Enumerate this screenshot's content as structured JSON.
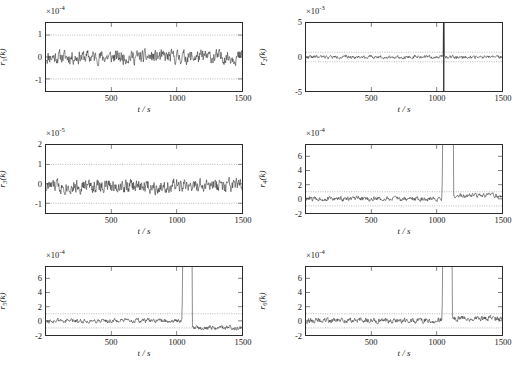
{
  "figure": {
    "caption": "",
    "panel_count": 6
  },
  "chart_data": [
    {
      "type": "line",
      "title": "",
      "panel_index": 1,
      "ylabel": "r",
      "ylabel_sub": "1",
      "ylabel_full": "r_1(k)",
      "xlabel": "t / s",
      "y_exponent_label": "×10",
      "y_exponent": "-4",
      "y_scale": 0.0001,
      "xlim": [
        0,
        1500
      ],
      "ylim": [
        -1.55,
        1.55
      ],
      "xticks": [
        500,
        1000,
        1500
      ],
      "xticklabels": [
        "500",
        "1000",
        "1500"
      ],
      "yticks": [
        -1,
        0,
        1
      ],
      "yticklabels": [
        "-1",
        "0",
        "1"
      ],
      "threshold_lines": [
        1,
        -1
      ],
      "grid": false,
      "noise_amplitude": 0.28,
      "noise_mean": 0.0,
      "fault_time": null,
      "fault_peak": null,
      "post_fault_mean": 0.0,
      "seed": 11
    },
    {
      "type": "line",
      "title": "",
      "panel_index": 2,
      "ylabel": "r",
      "ylabel_sub": "2",
      "ylabel_full": "r_2(k)",
      "xlabel": "t / s",
      "y_exponent_label": "×10",
      "y_exponent": "-3",
      "y_scale": 0.001,
      "xlim": [
        0,
        1500
      ],
      "ylim": [
        -5,
        5
      ],
      "xticks": [
        500,
        1000,
        1500
      ],
      "xticklabels": [
        "500",
        "1000",
        "1500"
      ],
      "yticks": [
        -5,
        0,
        5
      ],
      "yticklabels": [
        "-5",
        "0",
        "5"
      ],
      "threshold_lines": [
        0.7,
        -0.7
      ],
      "grid": false,
      "noise_amplitude": 0.22,
      "noise_mean": 0.0,
      "fault_time": 1050,
      "fault_peak": 5,
      "fault_type": "bipolar-impulse",
      "post_fault_mean": 0.0,
      "seed": 22
    },
    {
      "type": "line",
      "title": "",
      "panel_index": 3,
      "ylabel": "r",
      "ylabel_sub": "3",
      "ylabel_full": "r_3(k)",
      "xlabel": "t / s",
      "y_exponent_label": "×10",
      "y_exponent": "-5",
      "y_scale": 1e-05,
      "xlim": [
        0,
        1500
      ],
      "ylim": [
        -1.5,
        2
      ],
      "xticks": [
        500,
        1000,
        1500
      ],
      "xticklabels": [
        "500",
        "1000",
        "1500"
      ],
      "yticks": [
        -1,
        0,
        1,
        2
      ],
      "yticklabels": [
        "-1",
        "0",
        "1",
        "2"
      ],
      "threshold_lines": [
        1,
        -1
      ],
      "grid": false,
      "noise_amplitude": 0.32,
      "noise_mean": -0.12,
      "fault_time": null,
      "fault_peak": null,
      "post_fault_mean": -0.12,
      "seed": 33
    },
    {
      "type": "line",
      "title": "",
      "panel_index": 4,
      "ylabel": "r",
      "ylabel_sub": "4",
      "ylabel_full": "r_4(k)",
      "xlabel": "t / s",
      "y_exponent_label": "×10",
      "y_exponent": "-4",
      "y_scale": 0.0001,
      "xlim": [
        0,
        1500
      ],
      "ylim": [
        -2,
        7.6
      ],
      "xticks": [
        500,
        1000,
        1500
      ],
      "xticklabels": [
        "500",
        "1000",
        "1500"
      ],
      "yticks": [
        -2,
        0,
        2,
        4,
        6
      ],
      "yticklabels": [
        "-2",
        "0",
        "2",
        "4",
        "6"
      ],
      "threshold_lines": [
        1,
        -1
      ],
      "grid": false,
      "noise_amplitude": 0.3,
      "noise_mean": 0.0,
      "fault_time": 1040,
      "fault_peak": 7.6,
      "fault_type": "step-decay",
      "fault_decay_end": 1130,
      "post_fault_mean": 0.45,
      "seed": 44
    },
    {
      "type": "line",
      "title": "",
      "panel_index": 5,
      "ylabel": "r",
      "ylabel_sub": "5",
      "ylabel_full": "r_5(k)",
      "xlabel": "t / s",
      "y_exponent_label": "×10",
      "y_exponent": "-4",
      "y_scale": 0.0001,
      "xlim": [
        0,
        1500
      ],
      "ylim": [
        -2,
        7.6
      ],
      "xticks": [
        500,
        1000,
        1500
      ],
      "xticklabels": [
        "500",
        "1000",
        "1500"
      ],
      "yticks": [
        -2,
        0,
        2,
        4,
        6
      ],
      "yticklabels": [
        "-2",
        "0",
        "2",
        "4",
        "6"
      ],
      "threshold_lines": [
        1,
        -1
      ],
      "grid": false,
      "noise_amplitude": 0.28,
      "noise_mean": 0.0,
      "fault_time": 1040,
      "fault_peak": 7.6,
      "fault_type": "step-decay",
      "fault_decay_end": 1120,
      "post_fault_mean": -0.95,
      "seed": 55
    },
    {
      "type": "line",
      "title": "",
      "panel_index": 6,
      "ylabel": "r",
      "ylabel_sub": "6",
      "ylabel_full": "r_6(k)",
      "xlabel": "t / s",
      "y_exponent_label": "×10",
      "y_exponent": "-4",
      "y_scale": 0.0001,
      "xlim": [
        0,
        1500
      ],
      "ylim": [
        -2,
        7.6
      ],
      "xticks": [
        500,
        1000,
        1500
      ],
      "xticklabels": [
        "500",
        "1000",
        "1500"
      ],
      "yticks": [
        -2,
        0,
        2,
        4,
        6
      ],
      "yticklabels": [
        "-2",
        "0",
        "2",
        "4",
        "6"
      ],
      "threshold_lines": [
        1,
        -1
      ],
      "grid": false,
      "noise_amplitude": 0.34,
      "noise_mean": 0.05,
      "fault_time": 1040,
      "fault_peak": 7.6,
      "fault_type": "step-decay",
      "fault_decay_end": 1120,
      "post_fault_mean": 0.3,
      "seed": 66
    }
  ],
  "style": {
    "line_color": "#2b2b2b",
    "threshold_color": "#9a9a9a",
    "axis_color": "#2b2b2b",
    "background": "#ffffff"
  }
}
